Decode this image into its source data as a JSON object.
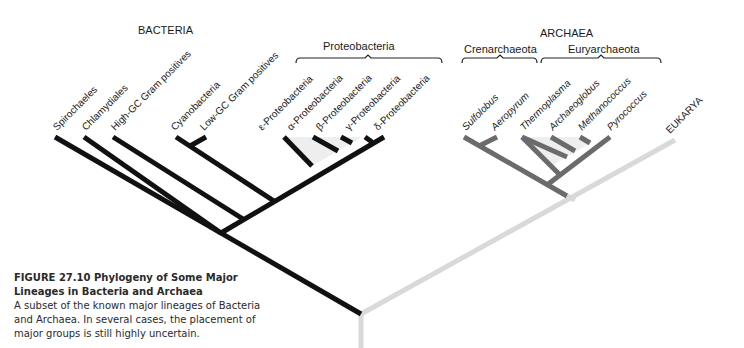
{
  "domains": {
    "bacteria": "BACTERIA",
    "archaea": "ARCHAEA",
    "eukarya": "EUKARYA"
  },
  "groups": {
    "proteobacteria": "Proteobacteria",
    "crenarchaeota": "Crenarchaeota",
    "euryarchaeota": "Euryarchaeota"
  },
  "taxa": {
    "bacteria": [
      "Spirochaeles",
      "Chlamydiales",
      "High-GC Gram positives",
      "Cyanobacteria",
      "Low-GC Gram positives"
    ],
    "proteobacteria": [
      "ε-Proteobacteria",
      "α-Proteobacteria",
      "β-Proteobacteria",
      "γ-Proteobacteria",
      "δ-Proteobacteria"
    ],
    "crenarchaeota": [
      "Sulfolobus",
      "Aeropyrum"
    ],
    "euryarchaeota": [
      "Thermoplasma",
      "Archaeoglobus",
      "Methanococcus",
      "Pyrococcus"
    ]
  },
  "colors": {
    "bacteria_branch": "#111111",
    "archaea_branch": "#6b6b6b",
    "eukarya_branch": "#d9d9d9",
    "shade": "#eeeeee"
  },
  "caption": {
    "title": "FIGURE 27.10  Phylogeny of Some Major Lineages in Bacteria and Archaea",
    "body": "A subset of the known major lineages of Bacteria and Archaea. In several cases, the placement of major groups is still highly uncertain."
  }
}
